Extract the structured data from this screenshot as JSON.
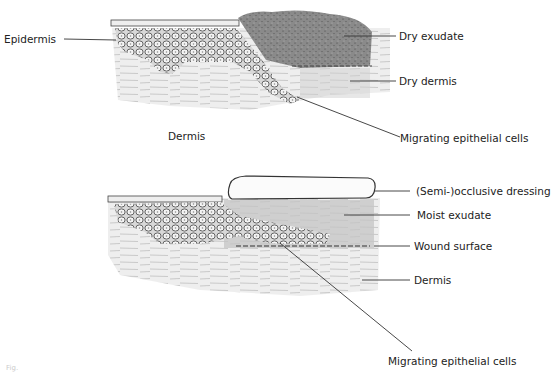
{
  "diagram": {
    "top_panel": {
      "name": "dry wound healing",
      "labels": {
        "epidermis": "Epidermis",
        "dry_exudate": "Dry exudate",
        "dry_dermis": "Dry dermis",
        "dermis": "Dermis",
        "migrating_cells": "Migrating epithelial cells"
      }
    },
    "bottom_panel": {
      "name": "moist wound healing",
      "labels": {
        "dressing": "(Semi-)occlusive dressing",
        "moist_exudate": "Moist exudate",
        "wound_surface": "Wound surface",
        "dermis": "Dermis",
        "migrating_cells": "Migrating epithelial cells"
      }
    },
    "figure_caption": "Fig."
  }
}
